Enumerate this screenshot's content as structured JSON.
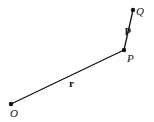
{
  "diagram": {
    "points": [
      {
        "id": "O",
        "label": "O",
        "x": 11,
        "y": 104
      },
      {
        "id": "P",
        "label": "P",
        "x": 124,
        "y": 50
      },
      {
        "id": "Q",
        "label": "Q",
        "x": 133,
        "y": 10
      }
    ],
    "segments": [
      {
        "from": "O",
        "to": "P",
        "label": "r"
      },
      {
        "from": "P",
        "to": "Q",
        "label": "p"
      }
    ],
    "colors": {
      "stroke": "#111111",
      "background": "#ffffff"
    }
  }
}
